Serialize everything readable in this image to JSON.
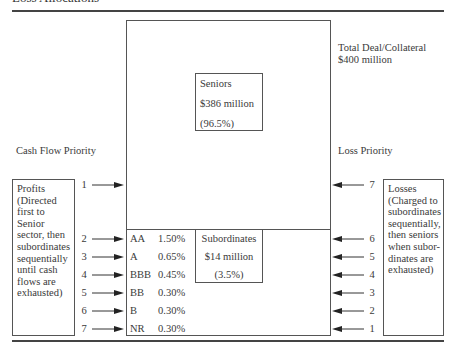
{
  "title": "Loss Allocations",
  "total": {
    "line1": "Total Deal/Collateral",
    "line2": "$400 million"
  },
  "seniors": {
    "name": "Seniors",
    "amount": "$386 million",
    "pct": "(96.5%)"
  },
  "subordinates": {
    "name": "Subordinates",
    "amount": "$14 million",
    "pct": "(3.5%)",
    "tranches": [
      {
        "rating": "AA",
        "pct": "1.50%"
      },
      {
        "rating": "A",
        "pct": "0.65%"
      },
      {
        "rating": "BBB",
        "pct": "0.45%"
      },
      {
        "rating": "BB",
        "pct": "0.30%"
      },
      {
        "rating": "B",
        "pct": "0.30%"
      },
      {
        "rating": "NR",
        "pct": "0.30%"
      }
    ]
  },
  "cash_flow": {
    "heading": "Cash Flow Priority",
    "box_lines": [
      "Profits",
      "(Directed",
      "first to Senior",
      "sector, then",
      "subordinates",
      "sequentially",
      "until cash",
      "flows are",
      "exhausted)"
    ],
    "order": [
      "1",
      "2",
      "3",
      "4",
      "5",
      "6",
      "7"
    ]
  },
  "loss": {
    "heading": "Loss Priority",
    "box_lines": [
      "Losses",
      "(Charged to",
      "subordinates",
      "sequentially,",
      "then seniors",
      "when subor-",
      "dinates are",
      "exhausted)"
    ],
    "order": [
      "7",
      "6",
      "5",
      "4",
      "3",
      "2",
      "1"
    ]
  }
}
